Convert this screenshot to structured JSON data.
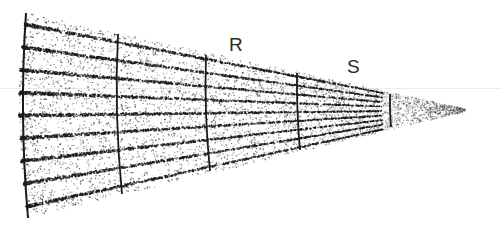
{
  "diagram": {
    "type": "tapering-wedge-cross-section",
    "labels": [
      {
        "id": "R",
        "text": "R",
        "x": 229,
        "y": 35
      },
      {
        "id": "S",
        "text": "S",
        "x": 347,
        "y": 57
      }
    ],
    "geometry": {
      "apex": [
        472,
        110
      ],
      "left_arc_top": [
        26,
        13
      ],
      "left_arc_bottom": [
        28,
        218
      ],
      "striation_count": 9,
      "boundaries": [
        {
          "name": "boundary-left-edge",
          "top": [
            26,
            13
          ],
          "bottom": [
            28,
            218
          ],
          "bulge": -8
        },
        {
          "name": "boundary-1",
          "top": [
            118,
            34
          ],
          "bottom": [
            122,
            194
          ],
          "bulge": -6
        },
        {
          "name": "boundary-2",
          "top": [
            206,
            55
          ],
          "bottom": [
            210,
            171
          ],
          "bulge": -4
        },
        {
          "name": "boundary-3",
          "top": [
            297,
            73
          ],
          "bottom": [
            300,
            150
          ],
          "bulge": -2
        },
        {
          "name": "boundary-4",
          "top": [
            390,
            94
          ],
          "bottom": [
            391,
            127
          ],
          "bulge": -1
        }
      ]
    },
    "colors": {
      "ink": "#1a1a1a",
      "stipple": "#333333",
      "background": "#ffffff"
    }
  }
}
